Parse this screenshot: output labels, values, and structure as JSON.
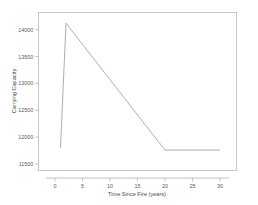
{
  "chart_data": {
    "type": "line",
    "title": "",
    "xlabel": "Time Since Fire (years)",
    "ylabel": "Carrying Capacity",
    "xlim": [
      -3,
      33
    ],
    "ylim": [
      11380,
      14320
    ],
    "xticks": [
      0,
      5,
      10,
      15,
      20,
      25,
      30
    ],
    "xtick_labels": [
      "0",
      "5",
      "10",
      "15",
      "20",
      "25",
      "30"
    ],
    "yticks": [
      11500,
      12000,
      12500,
      13000,
      13500,
      14000
    ],
    "ytick_labels": [
      "11500",
      "12000",
      "12500",
      "13000",
      "13500",
      "14000"
    ],
    "grid": false,
    "legend": null,
    "series": [
      {
        "name": "Carrying Capacity",
        "color": "#9a9a9a",
        "x": [
          1,
          2,
          20,
          30
        ],
        "values": [
          11800,
          14120,
          11760,
          11760
        ]
      }
    ]
  },
  "axis": {
    "ylabel_text": "Carrying Capacity",
    "xlabel_text": "Time Since Fire (years)"
  },
  "ticks": {
    "y": [
      "11500",
      "12000",
      "12500",
      "13000",
      "13500",
      "14000"
    ],
    "x": [
      "0",
      "5",
      "10",
      "15",
      "20",
      "25",
      "30"
    ]
  }
}
